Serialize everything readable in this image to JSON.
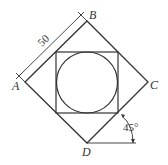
{
  "diagram": {
    "line_color": "#333333",
    "vertices": {
      "A": {
        "label": "A",
        "x": 25,
        "y": 82
      },
      "B": {
        "label": "B",
        "x": 87,
        "y": 21
      },
      "C": {
        "label": "C",
        "x": 148,
        "y": 82
      },
      "D": {
        "label": "D",
        "x": 87,
        "y": 143
      }
    },
    "inner_square": {
      "x": 56,
      "y": 52,
      "width": 62,
      "height": 61
    },
    "circle": {
      "cx": 87,
      "cy": 82,
      "r": 30
    },
    "dimension": {
      "label": "50",
      "from": "A",
      "to": "B"
    },
    "angle": {
      "label": "45°",
      "at": "D"
    }
  }
}
